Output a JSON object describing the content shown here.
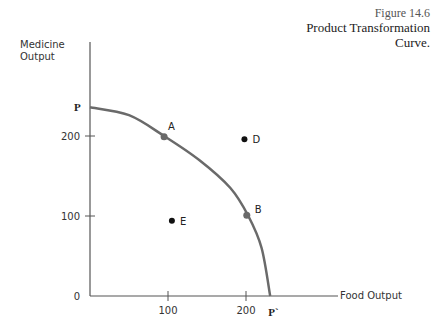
{
  "figure": {
    "number": "Figure 14.6",
    "title_line1": "Product Transformation",
    "title_line2": "Curve."
  },
  "chart_data": {
    "type": "line",
    "title": "Product Transformation Curve",
    "xlabel": "Food Output",
    "ylabel_line1": "Medicine",
    "ylabel_line2": "Output",
    "x_ticks": [
      100,
      200
    ],
    "y_ticks": [
      0,
      100,
      200
    ],
    "xlim": [
      0,
      300
    ],
    "ylim": [
      0,
      300
    ],
    "curve": {
      "name": "PP'",
      "color": "#6a6a6a",
      "points": [
        [
          0,
          236
        ],
        [
          50,
          226
        ],
        [
          95,
          200
        ],
        [
          140,
          170
        ],
        [
          180,
          135
        ],
        [
          203,
          100
        ],
        [
          220,
          60
        ],
        [
          231,
          0
        ]
      ]
    },
    "curve_end_labels": {
      "start": "P",
      "end": "P`"
    },
    "points": [
      {
        "label": "A",
        "x": 95,
        "y": 199,
        "on_curve": true
      },
      {
        "label": "B",
        "x": 201,
        "y": 101,
        "on_curve": true
      },
      {
        "label": "D",
        "x": 198,
        "y": 196,
        "on_curve": false
      },
      {
        "label": "E",
        "x": 105,
        "y": 94,
        "on_curve": false
      }
    ]
  }
}
